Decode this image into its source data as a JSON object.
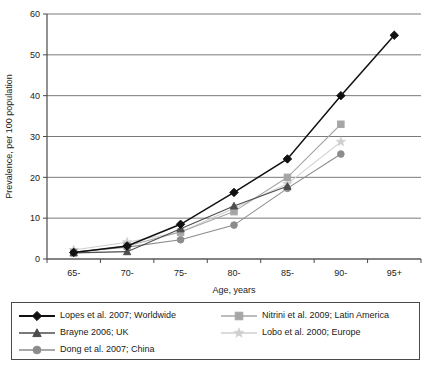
{
  "chart_data": {
    "type": "line",
    "title": "",
    "xlabel": "Age, years",
    "ylabel": "Prevalence, per 100 population",
    "categories": [
      "65-",
      "70-",
      "75-",
      "80-",
      "85-",
      "90-",
      "95+"
    ],
    "ylim": [
      0,
      60
    ],
    "yticks": [
      0,
      10,
      20,
      30,
      40,
      50,
      60
    ],
    "grid": "horizontal",
    "legend_position": "bottom",
    "series": [
      {
        "name": "Lopes et al. 2007; Worldwide",
        "marker": "diamond",
        "color": "#111111",
        "values": [
          1.6,
          3.2,
          8.5,
          16.3,
          24.5,
          40.0,
          54.8
        ]
      },
      {
        "name": "Brayne 2006; UK",
        "marker": "triangle",
        "color": "#4d4d4d",
        "values": [
          1.5,
          1.8,
          7.4,
          13.0,
          17.8,
          null,
          null
        ]
      },
      {
        "name": "Dong et al. 2007; China",
        "marker": "circle",
        "color": "#8c8c8c",
        "values": [
          1.7,
          2.9,
          4.7,
          8.3,
          17.3,
          25.7,
          null
        ]
      },
      {
        "name": "Nitrini et al. 2009; Latin America",
        "marker": "square",
        "color": "#a6a6a6",
        "values": [
          1.6,
          3.2,
          6.6,
          11.6,
          20.0,
          33.0,
          null
        ]
      },
      {
        "name": "Lobo et al. 2000; Europe",
        "marker": "star",
        "color": "#cfcfcf",
        "values": [
          2.2,
          4.1,
          6.6,
          12.4,
          18.4,
          28.7,
          null
        ]
      }
    ]
  },
  "axis": {
    "y_tick_labels": [
      "60",
      "50",
      "40",
      "30",
      "20",
      "10",
      "0"
    ],
    "x_tick_labels": [
      "65-",
      "70-",
      "75-",
      "80-",
      "85-",
      "90-",
      "95+"
    ],
    "x_title": "Age, years",
    "y_title": "Prevalence, per 100 population"
  },
  "legend": {
    "left_items": [
      {
        "label": "Lopes et al. 2007; Worldwide",
        "marker": "diamond",
        "color": "#111111"
      },
      {
        "label": "Brayne 2006; UK",
        "marker": "triangle",
        "color": "#4d4d4d"
      },
      {
        "label": "Dong et al. 2007; China",
        "marker": "circle",
        "color": "#8c8c8c"
      }
    ],
    "right_items": [
      {
        "label": "Nitrini et al. 2009; Latin America",
        "marker": "square",
        "color": "#a6a6a6"
      },
      {
        "label": "Lobo et al. 2000; Europe",
        "marker": "star",
        "color": "#cfcfcf"
      }
    ]
  },
  "colors": {
    "axis": "#4a4a4a",
    "grid": "#7a7a7a",
    "background": "#ffffff",
    "text": "#1a1a1a"
  }
}
